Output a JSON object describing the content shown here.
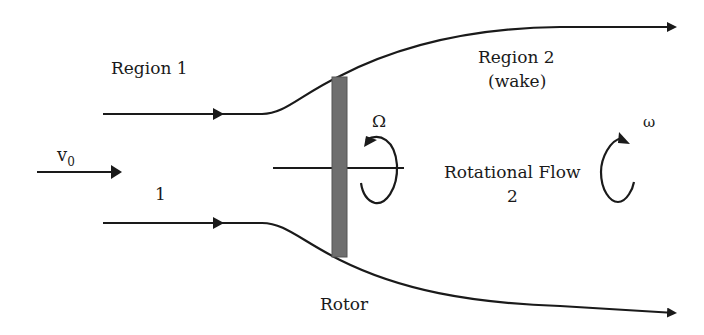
{
  "diagram": {
    "type": "flow-schematic",
    "labels": {
      "region1": "Region 1",
      "region2": "Region 2",
      "wake": "(wake)",
      "v0_main": "v",
      "v0_sub": "0",
      "station1": "1",
      "rotational_flow": "Rotational Flow",
      "station2": "2",
      "rotor": "Rotor",
      "omega_upper": "Ω",
      "omega_lower": "ω"
    },
    "colors": {
      "line": "#1a1a1a",
      "rotor_fill": "#6e6e6e",
      "rotor_stroke": "#555555",
      "background": "#ffffff"
    },
    "elements": [
      {
        "name": "upper-streamline",
        "kind": "streamtube-boundary",
        "direction": "right",
        "expands": true
      },
      {
        "name": "lower-streamline",
        "kind": "streamtube-boundary",
        "direction": "right",
        "expands": true
      },
      {
        "name": "free-stream-arrow",
        "kind": "velocity-arrow",
        "label": "v0"
      },
      {
        "name": "rotor-disc",
        "kind": "rotor"
      },
      {
        "name": "rotor-shaft",
        "kind": "axis"
      },
      {
        "name": "rotor-rotation-arrow",
        "kind": "rotation",
        "label": "Ω"
      },
      {
        "name": "wake-rotation-arrow",
        "kind": "rotation",
        "label": "ω"
      }
    ]
  }
}
